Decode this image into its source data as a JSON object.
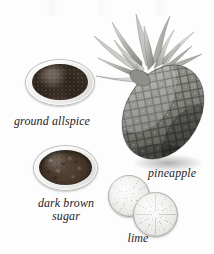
{
  "image": {
    "kind": "ingredient-photo-plate",
    "medium": "grayscale scanned photograph",
    "background_color": "#fdfdfd",
    "label_color": "#26231f",
    "width": 214,
    "height": 254
  },
  "items": [
    {
      "id": "ground-allspice",
      "label": "ground allspice",
      "vessel": "glass bowl",
      "contents": "fine dark brown ground spice powder",
      "color": "#4a3b2e"
    },
    {
      "id": "dark-brown-sugar",
      "label": "dark brown\nsugar",
      "vessel": "glass bowl",
      "contents": "clumped dark brown sugar granules",
      "color": "#46372a"
    },
    {
      "id": "pineapple",
      "label": "pineapple",
      "vessel": "whole fruit",
      "contents": "whole pineapple tilted with spiky leaf crown",
      "color": "#8a8a86"
    },
    {
      "id": "lime",
      "label": "lime",
      "vessel": "cut fruit",
      "contents": "two overlapping lime halves showing radial segments",
      "color": "#e2e2df"
    }
  ]
}
